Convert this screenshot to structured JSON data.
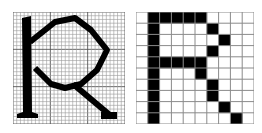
{
  "figure": {
    "letter": "R",
    "colors": {
      "ink": "#000000",
      "background": "#ffffff",
      "grid_fine": "#9a9a9a",
      "grid_major": "#555555",
      "grid_coarse": "#8a8a8a"
    }
  },
  "left_panel": {
    "name": "fine-grid-letter",
    "grid_divisions": 30,
    "major_every": 10
  },
  "right_panel": {
    "name": "coarse-pixel-letter",
    "cols": 10,
    "rows": 10,
    "filled_cells": [
      [
        0,
        1
      ],
      [
        0,
        2
      ],
      [
        0,
        3
      ],
      [
        0,
        4
      ],
      [
        0,
        5
      ],
      [
        1,
        1
      ],
      [
        1,
        6
      ],
      [
        2,
        1
      ],
      [
        2,
        7
      ],
      [
        3,
        1
      ],
      [
        3,
        6
      ],
      [
        4,
        1
      ],
      [
        4,
        2
      ],
      [
        4,
        3
      ],
      [
        4,
        4
      ],
      [
        4,
        5
      ],
      [
        5,
        1
      ],
      [
        5,
        5
      ],
      [
        6,
        1
      ],
      [
        6,
        6
      ],
      [
        7,
        1
      ],
      [
        7,
        6
      ],
      [
        8,
        1
      ],
      [
        8,
        7
      ],
      [
        9,
        1
      ],
      [
        9,
        8
      ]
    ]
  }
}
